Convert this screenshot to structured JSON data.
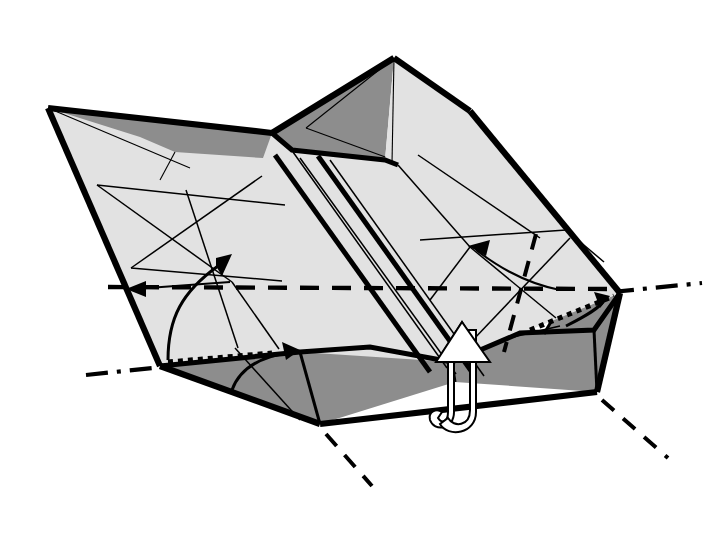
{
  "document": {
    "kind": "origami-folding-diagram",
    "title": "Origami step diagram",
    "background_color": "#ffffff",
    "width": 724,
    "height": 545
  },
  "palette": {
    "paper_front": "#e2e2e2",
    "paper_back": "#8d8d8d",
    "paper_back_mid": "#9a9a9a",
    "ink": "#000000",
    "arrow_fill": "#ffffff"
  },
  "model": {
    "name": "folded-box-base",
    "description": "Three-dimensional shallow box form in perspective with a raised central peak, pleated centre strip and two side walls.",
    "vertices": {
      "left_tip": [
        48,
        108
      ],
      "peak_apex": [
        394,
        58
      ],
      "peak_left_shoulder": [
        272,
        133
      ],
      "peak_right_base": [
        385,
        160
      ],
      "top_right_edge": [
        470,
        111
      ],
      "right_corner": [
        620,
        293
      ],
      "bottom_vertex": [
        320,
        424
      ],
      "left_corner": [
        160,
        366
      ],
      "front_right_low": [
        597,
        392
      ],
      "front_left_low": [
        320,
        424
      ]
    }
  },
  "faces": [
    {
      "id": "top-face-main",
      "name": "main-top-face",
      "tone": "paper_front"
    },
    {
      "id": "left-flap-dark",
      "name": "left-corner-back-flap",
      "tone": "paper_back"
    },
    {
      "id": "peak-left-dark",
      "name": "peak-left-face",
      "tone": "paper_back"
    },
    {
      "id": "peak-right-light",
      "name": "peak-right-face",
      "tone": "paper_front"
    },
    {
      "id": "front-wall-left",
      "name": "front-left-wall",
      "tone": "paper_back"
    },
    {
      "id": "front-wall-right",
      "name": "front-right-wall",
      "tone": "paper_back"
    },
    {
      "id": "right-wall",
      "name": "right-side-wall",
      "tone": "paper_back"
    }
  ],
  "fold_lines": {
    "valley_main": {
      "name": "main-valley-fold",
      "style": "dashed",
      "from": [
        160,
        355
      ],
      "to": [
        610,
        290
      ]
    },
    "valley_left": {
      "name": "left-valley-fold",
      "style": "dashed",
      "from": [
        110,
        290
      ],
      "to": [
        300,
        375
      ]
    },
    "valley_right": {
      "name": "right-valley-fold",
      "style": "dashed",
      "from": [
        534,
        236
      ],
      "to": [
        506,
        346
      ]
    },
    "axis_left": {
      "name": "left-rotation-axis",
      "style": "dash-dot",
      "from": [
        88,
        374
      ],
      "to": [
        163,
        366
      ]
    },
    "axis_right": {
      "name": "right-rotation-axis",
      "style": "dash-dot",
      "from": [
        622,
        291
      ],
      "to": [
        700,
        283
      ]
    },
    "axis_bottom": {
      "name": "bottom-hidden-axis",
      "style": "dashed",
      "from": [
        324,
        432
      ],
      "to": [
        370,
        482
      ]
    },
    "axis_bottom_right": {
      "name": "bottom-right-hidden-axis",
      "style": "dashed",
      "from": [
        600,
        398
      ],
      "to": [
        665,
        455
      ]
    }
  },
  "arrows": [
    {
      "id": "arrow-left-fold-up",
      "name": "left-fold-up-arrow",
      "type": "curved-solid",
      "meaning": "fold-up"
    },
    {
      "id": "arrow-left-point",
      "name": "left-pointer-arrow",
      "type": "straight-thin",
      "meaning": "indicate-edge"
    },
    {
      "id": "arrow-right-point",
      "name": "right-pointer-arrow",
      "type": "straight-thin",
      "meaning": "indicate-edge"
    },
    {
      "id": "arrow-front-left-rotate",
      "name": "front-left-rotate-arrow",
      "type": "curved-solid",
      "meaning": "rotate-wall"
    },
    {
      "id": "arrow-right-rotate",
      "name": "right-rotate-arrow",
      "type": "curved-solid",
      "meaning": "rotate-wall"
    },
    {
      "id": "arrow-pull-up",
      "name": "pull-up-white-arrow",
      "type": "white-3d-hook",
      "meaning": "pull-paper-up-and-out"
    }
  ],
  "labels": {
    "caption": "",
    "step_number": ""
  }
}
